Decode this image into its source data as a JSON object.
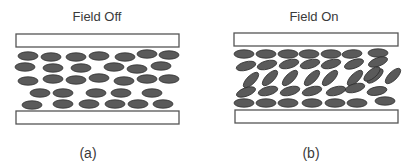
{
  "panels": [
    {
      "id": "a",
      "title": "Field Off",
      "caption": "(a)",
      "title_pos": [
        97,
        21
      ],
      "caption_pos": [
        88,
        158
      ],
      "top_plate": {
        "x": 16,
        "y": 34,
        "w": 163,
        "h": 13
      },
      "bottom_plate": {
        "x": 16,
        "y": 111,
        "w": 163,
        "h": 13
      },
      "molecules": [
        [
          28,
          56,
          0
        ],
        [
          51,
          57,
          0
        ],
        [
          76,
          57,
          0
        ],
        [
          99,
          56,
          0
        ],
        [
          125,
          57,
          0
        ],
        [
          147,
          54,
          0
        ],
        [
          169,
          55,
          0
        ],
        [
          25,
          67,
          0
        ],
        [
          53,
          68,
          0
        ],
        [
          81,
          68,
          0
        ],
        [
          114,
          67,
          0
        ],
        [
          137,
          69,
          0
        ],
        [
          161,
          66,
          0
        ],
        [
          28,
          81,
          0
        ],
        [
          53,
          79,
          0
        ],
        [
          76,
          80,
          0
        ],
        [
          99,
          78,
          0
        ],
        [
          124,
          81,
          0
        ],
        [
          147,
          79,
          0
        ],
        [
          169,
          79,
          0
        ],
        [
          40,
          93,
          0
        ],
        [
          63,
          93,
          0
        ],
        [
          96,
          93,
          0
        ],
        [
          121,
          93,
          0
        ],
        [
          152,
          93,
          0
        ],
        [
          32,
          105,
          0
        ],
        [
          63,
          104,
          0
        ],
        [
          89,
          104,
          0
        ],
        [
          115,
          104,
          0
        ],
        [
          138,
          104,
          0
        ],
        [
          163,
          104,
          0
        ]
      ]
    },
    {
      "id": "b",
      "title": "Field On",
      "caption": "(b)",
      "title_pos": [
        314,
        21
      ],
      "caption_pos": [
        311,
        158
      ],
      "top_plate": {
        "x": 234,
        "y": 33,
        "w": 164,
        "h": 13
      },
      "bottom_plate": {
        "x": 235,
        "y": 110,
        "w": 163,
        "h": 13
      },
      "molecules": [
        [
          244,
          54,
          0
        ],
        [
          266,
          54,
          0
        ],
        [
          288,
          54,
          0
        ],
        [
          309,
          54,
          0
        ],
        [
          331,
          54,
          0
        ],
        [
          352,
          54,
          -5
        ],
        [
          378,
          53,
          0
        ],
        [
          246,
          66,
          -15
        ],
        [
          267,
          65,
          -15
        ],
        [
          289,
          64,
          -15
        ],
        [
          310,
          64,
          -15
        ],
        [
          331,
          64,
          -15
        ],
        [
          354,
          64,
          -20
        ],
        [
          378,
          62,
          -20
        ],
        [
          251,
          80,
          -45
        ],
        [
          270,
          78,
          -45
        ],
        [
          290,
          78,
          -45
        ],
        [
          312,
          78,
          -45
        ],
        [
          330,
          78,
          -45
        ],
        [
          355,
          78,
          -45
        ],
        [
          375,
          76,
          -40
        ],
        [
          393,
          76,
          -45
        ],
        [
          372,
          74,
          -40
        ],
        [
          246,
          92,
          -20
        ],
        [
          268,
          91,
          -15
        ],
        [
          290,
          91,
          -15
        ],
        [
          312,
          91,
          -15
        ],
        [
          336,
          91,
          -15
        ],
        [
          355,
          88,
          -15
        ],
        [
          377,
          91,
          -10
        ],
        [
          244,
          103,
          0
        ],
        [
          266,
          103,
          0
        ],
        [
          288,
          103,
          0
        ],
        [
          312,
          103,
          0
        ],
        [
          335,
          103,
          0
        ],
        [
          357,
          103,
          0
        ],
        [
          385,
          101,
          0
        ]
      ]
    }
  ]
}
